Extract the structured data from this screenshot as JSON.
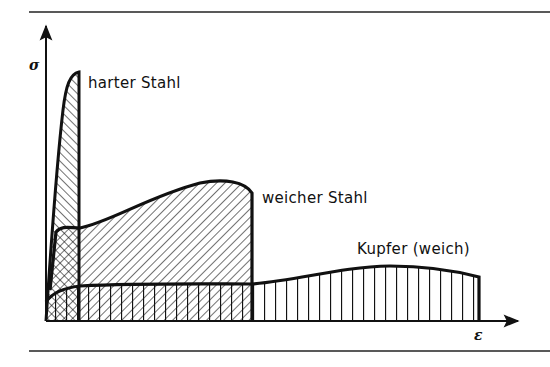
{
  "diagram": {
    "type": "stress-strain curves (Spannungs-Dehnungs-Diagramm)",
    "y_axis": {
      "symbol": "σ",
      "meaning": "stress"
    },
    "x_axis": {
      "symbol": "ε",
      "meaning": "strain"
    },
    "curves": [
      {
        "id": "hard-steel",
        "label": "harter Stahl",
        "hatch": "diagonal",
        "shape": "steep rise to very high peak, minimal elongation"
      },
      {
        "id": "soft-steel",
        "label": "weicher Stahl",
        "hatch": "diagonal (opposite)",
        "shape": "yield plateau then hump, medium elongation"
      },
      {
        "id": "copper",
        "label": "Kupfer (weich)",
        "hatch": "vertical",
        "shape": "low stress, long flat curve, largest elongation"
      }
    ],
    "colors": {
      "ink": "#111111",
      "background": "#ffffff"
    }
  }
}
